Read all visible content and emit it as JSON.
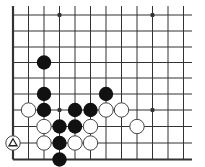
{
  "diagram": {
    "type": "go-board-fragment",
    "grid": {
      "x_positions": [
        13,
        28.5,
        44,
        59.5,
        75,
        90.5,
        106,
        121.5,
        137,
        152.5,
        168,
        183.5
      ],
      "y_positions": [
        15,
        31,
        47,
        62.5,
        78,
        94,
        110,
        126.5,
        143,
        159.5
      ],
      "right_extent": 192,
      "top_extent": 6,
      "left_edge": true,
      "bottom_edge": true,
      "line_color": "#333333",
      "edge_width": 2.2,
      "line_width": 1
    },
    "star_points": [
      {
        "col": 3,
        "row": 0
      },
      {
        "col": 9,
        "row": 0
      },
      {
        "col": 3,
        "row": 6
      },
      {
        "col": 9,
        "row": 6
      }
    ],
    "stone_radius": 7.2,
    "colors": {
      "black": "#111111",
      "white_fill": "#ffffff",
      "white_stroke": "#444444",
      "background": "#ffffff"
    },
    "black_stones": [
      {
        "col": 2,
        "row": 3
      },
      {
        "col": 2,
        "row": 5
      },
      {
        "col": 2,
        "row": 6
      },
      {
        "col": 6,
        "row": 5
      },
      {
        "col": 4,
        "row": 6
      },
      {
        "col": 5,
        "row": 6
      },
      {
        "col": 3,
        "row": 7
      },
      {
        "col": 4,
        "row": 7
      },
      {
        "col": 3,
        "row": 8
      },
      {
        "col": 3,
        "row": 9
      }
    ],
    "white_stones": [
      {
        "col": 1,
        "row": 6
      },
      {
        "col": 6,
        "row": 6
      },
      {
        "col": 7,
        "row": 6
      },
      {
        "col": 2,
        "row": 7
      },
      {
        "col": 5,
        "row": 7
      },
      {
        "col": 8,
        "row": 7
      },
      {
        "col": 2,
        "row": 8
      },
      {
        "col": 4,
        "row": 8
      },
      {
        "col": 5,
        "row": 8
      },
      {
        "col": 0,
        "row": 8,
        "marker": "triangle"
      }
    ]
  }
}
